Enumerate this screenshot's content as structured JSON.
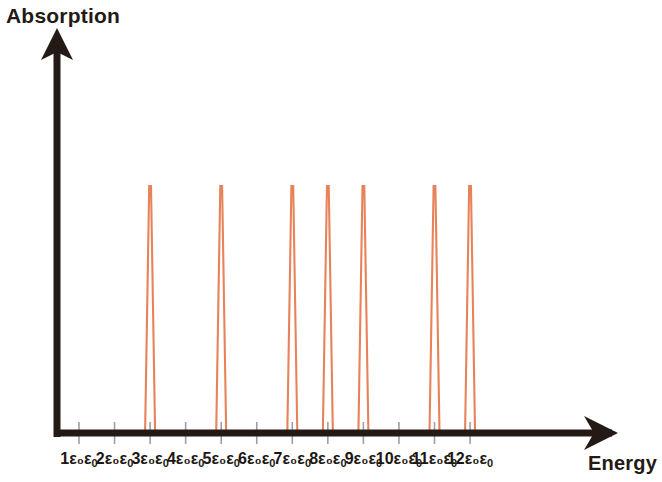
{
  "figure": {
    "y_axis_title": "Absorption",
    "x_axis_title": "Energy",
    "epsilon_symbol": "ε",
    "subscript": "0"
  },
  "chart_data": {
    "type": "bar",
    "title": "Absorption",
    "xlabel": "Energy",
    "ylabel": "Absorption",
    "grid": false,
    "legend": null,
    "x_unit": "ε₀",
    "categories": [
      "1ε₀",
      "2ε₀",
      "3ε₀",
      "4ε₀",
      "5ε₀",
      "6ε₀",
      "7ε₀",
      "8ε₀",
      "9ε₀",
      "10ε₀",
      "11ε₀",
      "12ε₀"
    ],
    "x": [
      1,
      2,
      3,
      4,
      5,
      6,
      7,
      8,
      9,
      10,
      11,
      12
    ],
    "values": [
      0,
      0,
      1,
      0,
      1,
      0,
      1,
      1,
      1,
      0,
      1,
      1
    ],
    "peak_positions": [
      3,
      5,
      7,
      8,
      9,
      11,
      12
    ],
    "peak_heights": [
      1,
      1,
      1,
      1,
      1,
      1,
      1
    ],
    "xlim": [
      0,
      13
    ],
    "ylim": [
      0,
      1.15
    ],
    "peak_color": "#e8825a",
    "axis_color": "#231a16",
    "tick_color": "#9aa0a6"
  },
  "ticks": [
    {
      "label": "1ε₀",
      "value": 1,
      "has_peak": false
    },
    {
      "label": "2ε₀",
      "value": 2,
      "has_peak": false
    },
    {
      "label": "3ε₀",
      "value": 3,
      "has_peak": true
    },
    {
      "label": "4ε₀",
      "value": 4,
      "has_peak": false
    },
    {
      "label": "5ε₀",
      "value": 5,
      "has_peak": true
    },
    {
      "label": "6ε₀",
      "value": 6,
      "has_peak": false
    },
    {
      "label": "7ε₀",
      "value": 7,
      "has_peak": true
    },
    {
      "label": "8ε₀",
      "value": 8,
      "has_peak": true
    },
    {
      "label": "9ε₀",
      "value": 9,
      "has_peak": true
    },
    {
      "label": "10ε₀",
      "value": 10,
      "has_peak": false
    },
    {
      "label": "11ε₀",
      "value": 11,
      "has_peak": true
    },
    {
      "label": "12ε₀",
      "value": 12,
      "has_peak": true
    }
  ]
}
